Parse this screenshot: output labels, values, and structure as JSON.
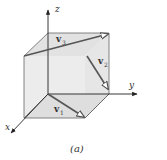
{
  "figure": {
    "caption": "(a)",
    "axes": {
      "x": "x",
      "y": "y",
      "z": "z"
    },
    "vectors": [
      {
        "name": "v",
        "sub": "1"
      },
      {
        "name": "v",
        "sub": "2"
      },
      {
        "name": "v",
        "sub": "3"
      }
    ],
    "colors": {
      "face": "#e6e6e6",
      "edge": "#555555",
      "vector": "#555555",
      "axis": "#222222"
    }
  }
}
